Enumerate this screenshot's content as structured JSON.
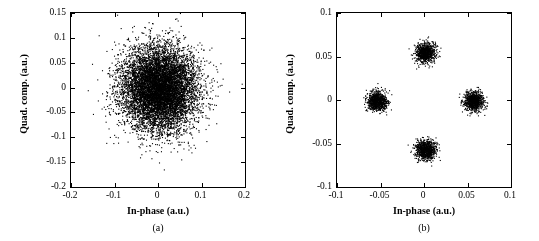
{
  "figure": {
    "panels": [
      {
        "tag": "(a)",
        "xlabel": "In-phase (a.u.)",
        "ylabel": "Quad. comp. (a.u.)",
        "xticks": [
          "-0.2",
          "-0.1",
          "0",
          "0.1",
          "0.2"
        ],
        "yticks": [
          "-0.2",
          "-0.15",
          "-0.1",
          "-0.05",
          "0",
          "0.05",
          "0.1",
          "0.15"
        ]
      },
      {
        "tag": "(b)",
        "xlabel": "In-phase (a.u.)",
        "ylabel": "Quad. comp. (a.u.)",
        "xticks": [
          "-0.1",
          "-0.05",
          "0",
          "0.05",
          "0.1"
        ],
        "yticks": [
          "-0.1",
          "-0.05",
          "0",
          "0.05",
          "0.1"
        ]
      }
    ]
  },
  "chart_data": [
    {
      "type": "scatter",
      "title": "(a)",
      "xlabel": "In-phase (a.u.)",
      "ylabel": "Quad. comp. (a.u.)",
      "xlim": [
        -0.2,
        0.2
      ],
      "ylim": [
        -0.2,
        0.15
      ],
      "xticks": [
        -0.2,
        -0.1,
        0,
        0.1,
        0.2
      ],
      "yticks": [
        -0.2,
        -0.15,
        -0.1,
        -0.05,
        0,
        0.05,
        0.1,
        0.15
      ],
      "grid": false,
      "legend": false,
      "marker_color": "#000000",
      "description": "Single dense circular Gaussian cloud of points centred at the origin (noise / thermal state); radius about 0.085 a.u. with sparse outliers to ~0.13",
      "clusters": [
        {
          "center": [
            0.0,
            0.0
          ],
          "sigma": 0.042,
          "n_points": 9000
        }
      ]
    },
    {
      "type": "scatter",
      "title": "(b)",
      "xlabel": "In-phase (a.u.)",
      "ylabel": "Quad. comp. (a.u.)",
      "xlim": [
        -0.1,
        0.1
      ],
      "ylim": [
        -0.1,
        0.1
      ],
      "xticks": [
        -0.1,
        -0.05,
        0,
        0.05,
        0.1
      ],
      "yticks": [
        -0.1,
        -0.05,
        0,
        0.05,
        0.1
      ],
      "grid": false,
      "legend": false,
      "marker_color": "#000000",
      "description": "Four compact point clusters arranged in a QPSK-like constellation at 0, 90, 180, 270 degrees, radius about 0.055 a.u.",
      "clusters": [
        {
          "center": [
            0.0,
            0.055
          ],
          "sigma": 0.0055,
          "n_points": 900
        },
        {
          "center": [
            0.0,
            -0.055
          ],
          "sigma": 0.0055,
          "n_points": 900
        },
        {
          "center": [
            0.055,
            0.0
          ],
          "sigma": 0.0055,
          "n_points": 900
        },
        {
          "center": [
            -0.055,
            0.0
          ],
          "sigma": 0.0055,
          "n_points": 900
        }
      ]
    }
  ]
}
